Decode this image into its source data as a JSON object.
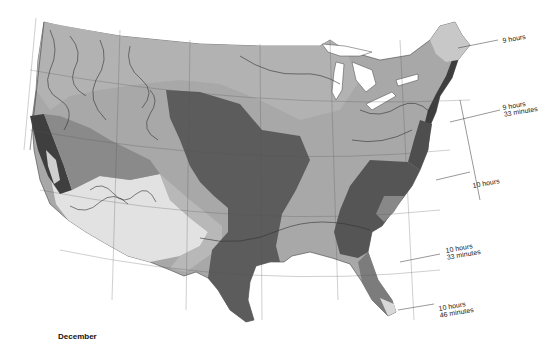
{
  "map": {
    "month": "December",
    "zone_labels": [
      {
        "id": "zone-9h",
        "text": "9 hours",
        "line2": ""
      },
      {
        "id": "zone-9h33",
        "text": "9 hours",
        "line2": "33 minutes"
      },
      {
        "id": "zone-10h",
        "text": "10 hours",
        "line2": ""
      },
      {
        "id": "zone-10h33",
        "text": "10 hours",
        "line2": "33 minutes"
      },
      {
        "id": "zone-10h46",
        "text": "10 hours",
        "line2": "46 minutes"
      }
    ],
    "shading_colors": {
      "lightest": "#e6e6e6",
      "light": "#c4c4c4",
      "medium": "#a3a3a3",
      "dark": "#6f6f6f",
      "darkest": "#4a4a4a",
      "water": "#ffffff",
      "contour": "#333333"
    }
  }
}
